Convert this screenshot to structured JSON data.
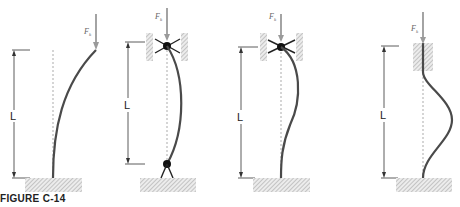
{
  "figure": {
    "caption": "FIGURE C-14",
    "length_label": "L",
    "force_label": "F",
    "force_subscript": "k"
  },
  "panels": [
    {
      "id": "fixed-free",
      "top_support": "free",
      "bottom_support": "fixed",
      "buckled_shape": "quarter-sine curve"
    },
    {
      "id": "pinned-pinned",
      "top_support": "pinned (roller guide)",
      "bottom_support": "pinned",
      "buckled_shape": "half-sine bow"
    },
    {
      "id": "pinned-fixed",
      "top_support": "pinned (roller guide)",
      "bottom_support": "fixed",
      "buckled_shape": "S-curve"
    },
    {
      "id": "fixed-fixed",
      "top_support": "fixed (sliding guide)",
      "bottom_support": "fixed",
      "buckled_shape": "full-sine wave"
    }
  ],
  "colors": {
    "column": "#4a4a4a",
    "force_arrow": "#9a9a9a",
    "dotted_axis": "#c8c8c8",
    "hatch": "#9a9a9a",
    "dimension": "#333333"
  }
}
